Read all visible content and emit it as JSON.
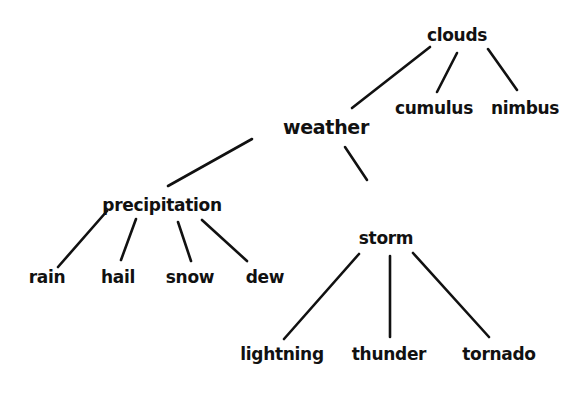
{
  "diagram": {
    "type": "concept-map",
    "root": "weather",
    "nodes": {
      "weather": {
        "label": "weather",
        "x": 326,
        "y": 127
      },
      "clouds": {
        "label": "clouds",
        "x": 457,
        "y": 35
      },
      "cumulus": {
        "label": "cumulus",
        "x": 434,
        "y": 108
      },
      "nimbus": {
        "label": "nimbus",
        "x": 525,
        "y": 108
      },
      "precipitation": {
        "label": "precipitation",
        "x": 162,
        "y": 205
      },
      "rain": {
        "label": "rain",
        "x": 47,
        "y": 277
      },
      "hail": {
        "label": "hail",
        "x": 118,
        "y": 277
      },
      "snow": {
        "label": "snow",
        "x": 190,
        "y": 277
      },
      "dew": {
        "label": "dew",
        "x": 265,
        "y": 277
      },
      "storm": {
        "label": "storm",
        "x": 386,
        "y": 238
      },
      "lightning": {
        "label": "lightning",
        "x": 282,
        "y": 354
      },
      "thunder": {
        "label": "thunder",
        "x": 389,
        "y": 354
      },
      "tornado": {
        "label": "tornado",
        "x": 499,
        "y": 354
      }
    },
    "edges": [
      {
        "from": "weather",
        "to": "clouds"
      },
      {
        "from": "clouds",
        "to": "cumulus"
      },
      {
        "from": "clouds",
        "to": "nimbus"
      },
      {
        "from": "weather",
        "to": "precipitation"
      },
      {
        "from": "precipitation",
        "to": "rain"
      },
      {
        "from": "precipitation",
        "to": "hail"
      },
      {
        "from": "precipitation",
        "to": "snow"
      },
      {
        "from": "precipitation",
        "to": "dew"
      },
      {
        "from": "weather",
        "to": "storm"
      },
      {
        "from": "storm",
        "to": "lightning"
      },
      {
        "from": "storm",
        "to": "thunder"
      },
      {
        "from": "storm",
        "to": "tornado"
      }
    ]
  }
}
